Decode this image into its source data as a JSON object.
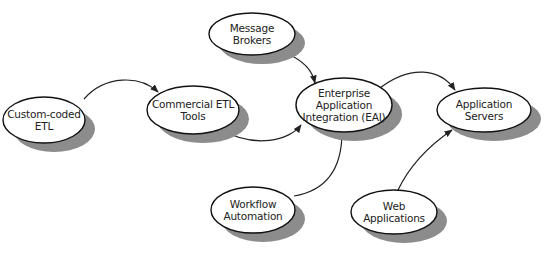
{
  "diagram": {
    "colors": {
      "stroke": "#111111",
      "fill": "#ffffff",
      "shadow": "#8c8c8c",
      "edge": "#222222"
    },
    "nodes": [
      {
        "id": "custom-coded-etl",
        "label": "Custom-coded\nETL",
        "cx": 44,
        "cy": 120,
        "rx": 41,
        "ry": 23
      },
      {
        "id": "commercial-etl-tools",
        "label": "Commercial ETL\nTools",
        "cx": 193,
        "cy": 110,
        "rx": 46,
        "ry": 24
      },
      {
        "id": "message-brokers",
        "label": "Message Brokers",
        "cx": 252,
        "cy": 34,
        "rx": 43,
        "ry": 21
      },
      {
        "id": "eai",
        "label": "Enterprise\nApplication\nIntegration (EAI)",
        "cx": 344,
        "cy": 105,
        "rx": 48,
        "ry": 27
      },
      {
        "id": "application-servers",
        "label": "Application Servers",
        "cx": 484,
        "cy": 110,
        "rx": 47,
        "ry": 22
      },
      {
        "id": "workflow-automation",
        "label": "Workflow\nAutomation",
        "cx": 253,
        "cy": 210,
        "rx": 42,
        "ry": 23
      },
      {
        "id": "web-applications",
        "label": "Web Applications",
        "cx": 394,
        "cy": 212,
        "rx": 43,
        "ry": 22
      }
    ],
    "edges": [
      {
        "from": "custom-coded-etl",
        "to": "commercial-etl-tools"
      },
      {
        "from": "commercial-etl-tools",
        "to": "eai"
      },
      {
        "from": "message-brokers",
        "to": "eai"
      },
      {
        "from": "workflow-automation",
        "to": "eai"
      },
      {
        "from": "eai",
        "to": "application-servers"
      },
      {
        "from": "web-applications",
        "to": "application-servers"
      }
    ]
  }
}
